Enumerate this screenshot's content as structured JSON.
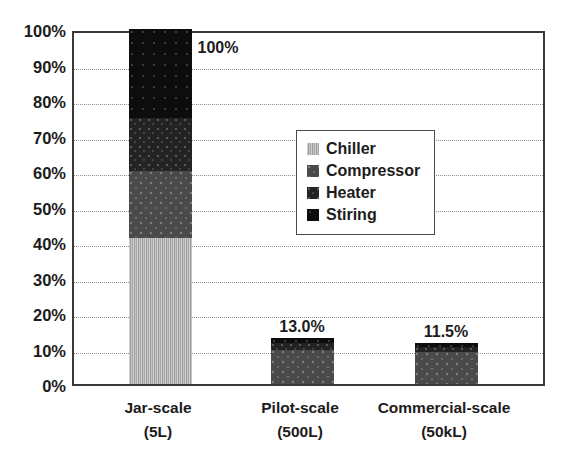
{
  "chart_data": {
    "type": "bar",
    "subtype": "stacked-bar",
    "title": "",
    "xlabel": "",
    "ylabel": "",
    "ylim": [
      0,
      100
    ],
    "y_unit": "%",
    "grid": true,
    "legend_position": "inside-center-right",
    "categories": [
      "Jar-scale\n(5L)",
      "Pilot-scale\n(500L)",
      "Commercial-scale\n(50kL)"
    ],
    "category_lines": [
      {
        "name": "Jar-scale",
        "sub": "(5L)"
      },
      {
        "name": "Pilot-scale",
        "sub": "(500L)"
      },
      {
        "name": "Commercial-scale",
        "sub": "(50kL)"
      }
    ],
    "yticks": [
      "0%",
      "10%",
      "20%",
      "30%",
      "40%",
      "50%",
      "60%",
      "70%",
      "80%",
      "90%",
      "100%"
    ],
    "ytick_values": [
      0,
      10,
      20,
      30,
      40,
      50,
      60,
      70,
      80,
      90,
      100
    ],
    "series": [
      {
        "name": "Chiller",
        "values": [
          41.0,
          0.0,
          0.0
        ]
      },
      {
        "name": "Compressor",
        "values": [
          19.0,
          9.5,
          9.0
        ]
      },
      {
        "name": "Heater",
        "values": [
          15.0,
          2.0,
          1.5
        ]
      },
      {
        "name": "Stiring",
        "values": [
          25.0,
          1.5,
          1.0
        ]
      }
    ],
    "totals": [
      100.0,
      13.0,
      11.5
    ],
    "data_labels": [
      "100%",
      "13.0%",
      "11.5%"
    ]
  },
  "legend": {
    "items": [
      {
        "label": "Chiller",
        "swatch": "chiller-swatch-icon"
      },
      {
        "label": "Compressor",
        "swatch": "compressor-swatch-icon"
      },
      {
        "label": "Heater",
        "swatch": "heater-swatch-icon"
      },
      {
        "label": "Stiring",
        "swatch": "stiring-swatch-icon"
      }
    ]
  },
  "artifact": {
    "ghost_top": "",
    "ghost_title": ""
  }
}
